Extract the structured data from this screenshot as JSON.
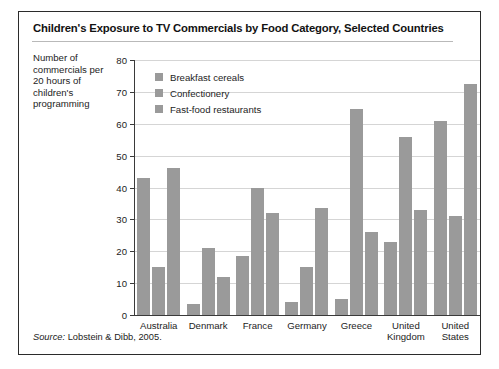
{
  "figure": {
    "title": "Children's Exposure to TV Commercials by Food Category, Selected Countries",
    "source_prefix": "Source:",
    "source_text": "Lobstein & Dibb, 2005."
  },
  "axis": {
    "y_title": "Number of commercials per 20 hours of children's programming",
    "y_ticks": [
      "0",
      "10",
      "20",
      "30",
      "40",
      "50",
      "60",
      "70",
      "80"
    ]
  },
  "colors": {
    "bar_fill": "#9a9a9a",
    "gridline": "#d5d5d5",
    "axis": "#3a3a3a",
    "frame": "#2b2b2b",
    "text": "#1d1d1d"
  },
  "chart_data": {
    "type": "bar",
    "title": "Children's Exposure to TV Commercials by Food Category, Selected Countries",
    "xlabel": "",
    "ylabel": "Number of commercials per 20 hours of children's programming",
    "ylim": [
      0,
      80
    ],
    "ytick_step": 10,
    "grid": true,
    "legend_position": "top-left inside plot",
    "categories": [
      "Australia",
      "Denmark",
      "France",
      "Germany",
      "Greece",
      "United Kingdom",
      "United States"
    ],
    "series": [
      {
        "name": "Breakfast cereals",
        "values": [
          43,
          3.5,
          18.5,
          4,
          5,
          23,
          61
        ]
      },
      {
        "name": "Confectionery",
        "values": [
          15,
          21,
          40,
          15,
          64.5,
          56,
          31
        ]
      },
      {
        "name": "Fast-food restaurants",
        "values": [
          46,
          12,
          32,
          33.5,
          26,
          33,
          72.5
        ]
      }
    ],
    "source": "Lobstein & Dibb, 2005."
  },
  "x_labels": [
    [
      "Australia"
    ],
    [
      "Denmark"
    ],
    [
      "France"
    ],
    [
      "Germany"
    ],
    [
      "Greece"
    ],
    [
      "United",
      "Kingdom"
    ],
    [
      "United",
      "States"
    ]
  ]
}
